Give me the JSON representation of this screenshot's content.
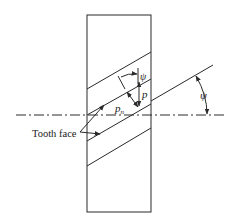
{
  "figure": {
    "labels": {
      "psi_top": "ψ",
      "psi_right": "ψ",
      "p": "p",
      "pn_base": "p",
      "pn_sub": "n",
      "tooth_face": "Tooth face"
    },
    "colors": {
      "line": "#2a2a2a",
      "background": "#ffffff"
    }
  }
}
